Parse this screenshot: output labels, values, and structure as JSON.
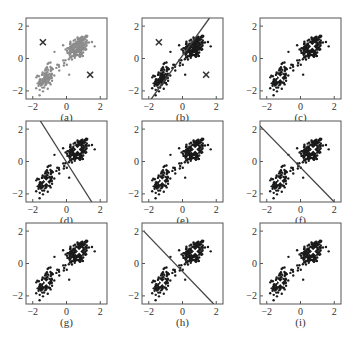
{
  "chart_data": {
    "type": "scatter",
    "title": "",
    "layout": "3x3 grid of scatter panels (k-means iterations)",
    "xlim": [
      -2.4,
      2.4
    ],
    "ylim": [
      -2.5,
      2.5
    ],
    "xticks": [
      -2,
      0,
      2
    ],
    "yticks": [
      -2,
      0,
      2
    ],
    "xtick_labels": [
      "−2",
      "0",
      "2"
    ],
    "ytick_labels": [
      "−2",
      "0",
      "2"
    ],
    "grid": false,
    "clusters": [
      {
        "name": "upper-right",
        "center": [
          0.7,
          0.7
        ],
        "sx": 0.35,
        "sy": 0.38,
        "rho": 0.3,
        "n": 180
      },
      {
        "name": "lower-left",
        "center": [
          -1.25,
          -1.25
        ],
        "sx": 0.22,
        "sy": 0.38,
        "rho": 0.3,
        "n": 100
      },
      {
        "name": "bridge",
        "center": [
          -0.2,
          -0.25
        ],
        "sx": 0.35,
        "sy": 0.3,
        "rho": 0.6,
        "n": 16
      }
    ],
    "panels": [
      {
        "label": "(a)",
        "point_color": "#8c8c8c",
        "centroids": [
          [
            -1.4,
            1.0
          ],
          [
            1.4,
            -1.0
          ]
        ],
        "centroid_style": "dark-x",
        "boundary": null
      },
      {
        "label": "(b)",
        "point_color": "#1a1a1a",
        "centroids": [
          [
            -1.4,
            1.0
          ],
          [
            1.4,
            -1.0
          ]
        ],
        "centroid_style": "dark-x",
        "boundary": [
          [
            -1.85,
            -2.5
          ],
          [
            1.6,
            2.5
          ]
        ]
      },
      {
        "label": "(c)",
        "point_color": "#1a1a1a",
        "centroids": [
          [
            0.7,
            0.75
          ],
          [
            -1.2,
            -1.2
          ]
        ],
        "centroid_style": "white-x",
        "boundary": null
      },
      {
        "label": "(d)",
        "point_color": "#1a1a1a",
        "centroids": [
          [
            0.65,
            0.75
          ],
          [
            -1.2,
            -1.25
          ]
        ],
        "centroid_style": "white-x",
        "boundary": [
          [
            -1.55,
            2.5
          ],
          [
            1.5,
            -2.5
          ]
        ]
      },
      {
        "label": "(e)",
        "point_color": "#1a1a1a",
        "centroids": [
          [
            0.75,
            0.75
          ],
          [
            -1.2,
            -1.2
          ]
        ],
        "centroid_style": "white-x",
        "boundary": null
      },
      {
        "label": "(f)",
        "point_color": "#1a1a1a",
        "centroids": [
          [
            0.75,
            0.75
          ],
          [
            -1.2,
            -1.2
          ]
        ],
        "centroid_style": "white-x",
        "boundary": [
          [
            -2.4,
            2.2
          ],
          [
            2.0,
            -2.5
          ]
        ]
      },
      {
        "label": "(g)",
        "point_color": "#1a1a1a",
        "centroids": [
          [
            0.75,
            0.75
          ],
          [
            -1.2,
            -1.2
          ]
        ],
        "centroid_style": "white-x",
        "boundary": null
      },
      {
        "label": "(h)",
        "point_color": "#1a1a1a",
        "centroids": [
          [
            0.75,
            0.75
          ],
          [
            -1.2,
            -1.2
          ]
        ],
        "centroid_style": "white-x",
        "boundary": [
          [
            -2.3,
            2.0
          ],
          [
            1.85,
            -2.5
          ]
        ]
      },
      {
        "label": "(i)",
        "point_color": "#1a1a1a",
        "centroids": [
          [
            0.75,
            0.75
          ],
          [
            -1.2,
            -1.2
          ]
        ],
        "centroid_style": "white-x",
        "boundary": null
      }
    ]
  },
  "colors": {
    "frame": "#555555",
    "boundary_line": "#444444",
    "dark_cross": "#333333",
    "white_cross": "#ffffff"
  }
}
